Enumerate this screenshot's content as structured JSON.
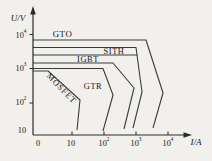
{
  "figure": {
    "background": "#f1f0ec",
    "line_color": "#3c3c3c",
    "axis_color": "#2a2a2a",
    "text_color": "#151515"
  },
  "axes": {
    "y_unit_label": "U/V",
    "x_unit_label": "I/A",
    "y_tick_labels": [
      "10^4",
      "10^3",
      "10^2",
      "10"
    ],
    "x_tick_labels": [
      "0",
      "10",
      "10^2",
      "10^3",
      "10^4"
    ]
  },
  "chart_data": {
    "type": "line",
    "title": "",
    "xlabel": "I/A",
    "ylabel": "U/V",
    "x_scale": "log",
    "y_scale": "log",
    "x_range_A": [
      0,
      10000
    ],
    "y_range_V": [
      10,
      10000
    ],
    "grid": false,
    "legend": "none (labels placed inside regions)",
    "series": [
      {
        "name": "GTO",
        "boundary_points_IA_UV": [
          [
            0,
            6300
          ],
          [
            2000,
            6300
          ],
          [
            7000,
            200
          ],
          [
            3400,
            19
          ]
        ]
      },
      {
        "name": "SITH",
        "boundary_points_IA_UV": [
          [
            0,
            4200
          ],
          [
            1000,
            4200
          ],
          [
            1550,
            215
          ],
          [
            800,
            19
          ]
        ],
        "band_lower_edge_UV": 2500
      },
      {
        "name": "IGBT",
        "boundary_points_IA_UV": [
          [
            0,
            1500
          ],
          [
            190,
            1500
          ],
          [
            870,
            280
          ],
          [
            420,
            18
          ]
        ]
      },
      {
        "name": "GTR",
        "boundary_points_IA_UV": [
          [
            0,
            1000
          ],
          [
            93,
            1000
          ],
          [
            190,
            175
          ],
          [
            93,
            15
          ]
        ]
      },
      {
        "name": "MOSFET",
        "boundary_points_IA_UV": [
          [
            0,
            870
          ],
          [
            1.8,
            870
          ],
          [
            18,
            125
          ],
          [
            16,
            16
          ]
        ]
      }
    ],
    "render": {
      "y_axis": {
        "x": 33,
        "y_top": 11,
        "y_bottom": 135,
        "arrow": [
          [
            33,
            6
          ],
          [
            30.2,
            14.5
          ],
          [
            35.8,
            14.5
          ]
        ]
      },
      "x_axis": {
        "y": 135,
        "x_left": 33,
        "x_right": 186,
        "arrow": [
          [
            192,
            135
          ],
          [
            183.5,
            132.2
          ],
          [
            183.5,
            137.8
          ]
        ]
      },
      "y_ticks_px": [
        34.5,
        68.5,
        103
      ],
      "x_ticks_px": [
        72,
        104,
        136,
        168
      ],
      "tick_len": 3.5,
      "y_tick_label_pos": [
        [
          21,
          36
        ],
        [
          21,
          69
        ],
        [
          21,
          103
        ],
        [
          22,
          131
        ]
      ],
      "x_tick_label_pos": [
        [
          38,
          144
        ],
        [
          71,
          144
        ],
        [
          104,
          144
        ],
        [
          136,
          144
        ],
        [
          168,
          144
        ]
      ],
      "y_unit_label_pos": [
        18,
        18
      ],
      "x_unit_label_pos": [
        196,
        142
      ],
      "boundaries_px": [
        {
          "name": "GTO",
          "points": [
            [
              33,
              40
            ],
            [
              146,
              40
            ],
            [
              163,
              93
            ],
            [
              153,
              128
            ]
          ]
        },
        {
          "name": "SITH",
          "points": [
            [
              33,
              47.5
            ],
            [
              136,
              47.5
            ],
            [
              142,
              92
            ],
            [
              133,
              128
            ]
          ]
        },
        {
          "name": "SITH-band-bottom",
          "points": [
            [
              33,
              55
            ],
            [
              137.5,
              55
            ]
          ]
        },
        {
          "name": "IGBT",
          "points": [
            [
              33,
              63
            ],
            [
              113,
              63
            ],
            [
              134,
              88
            ],
            [
              124,
              129
            ]
          ]
        },
        {
          "name": "GTR",
          "points": [
            [
              33,
              68.5
            ],
            [
              103,
              68.5
            ],
            [
              113,
              95
            ],
            [
              103,
              131
            ]
          ]
        },
        {
          "name": "MOSFET",
          "points": [
            [
              33,
              71
            ],
            [
              48,
              71
            ],
            [
              80,
              100
            ],
            [
              77,
              130
            ]
          ]
        }
      ],
      "region_labels": [
        {
          "text": "GTO",
          "x": 62.5,
          "y": 33.5,
          "rotated": false,
          "big": true
        },
        {
          "text": "SITH",
          "x": 114,
          "y": 51.5,
          "rotated": false,
          "big": false
        },
        {
          "text": "IGBT",
          "x": 88,
          "y": 59.5,
          "rotated": false,
          "big": false
        },
        {
          "text": "GTR",
          "x": 93,
          "y": 87,
          "rotated": false,
          "big": false
        },
        {
          "text": "MOSFET",
          "x": 61,
          "y": 89,
          "rotated": true,
          "big": false
        }
      ]
    }
  }
}
